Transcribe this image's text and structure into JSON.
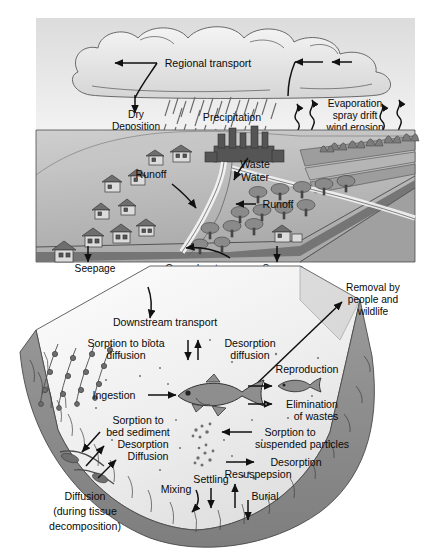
{
  "figure": {
    "background": "#ffffff",
    "sky_color": "#e6e6e6",
    "land_color": "#b8b8b8",
    "water_color": "#ececec",
    "sediment_color": "#8f8f8f",
    "ink_color": "#111111"
  },
  "atmosphere": {
    "regional_transport": "Regional transport",
    "dry_deposition": "Dry\nDeposition",
    "dry_deposition_line1": "Dry",
    "dry_deposition_line2": "Deposition",
    "precipitation": "Precipitation",
    "evaporation_line1": "Evaporation",
    "evaporation_line2": "spray drift",
    "evaporation_line3": "wind erosion"
  },
  "land": {
    "runoff_upper": "Runoff",
    "runoff_lower": "Runoff",
    "waste_water_line1": "Waste",
    "waste_water_line2": "Water",
    "seepage_left": "Seepage",
    "seepage_right": "Seepage",
    "ground_water_line1": "Ground water",
    "ground_water_line2": "discharge",
    "ground_water_line3": "to streams",
    "removal_line1": "Removal by",
    "removal_line2": "people and",
    "removal_line3": "wildlife"
  },
  "water": {
    "downstream_transport": "Downstream transport",
    "sorption_biota_line1": "Sorption to biota",
    "sorption_biota_line2": "diffusion",
    "desorption_line1": "Desorption",
    "desorption_line2": "diffusion",
    "ingestion": "Ingestion",
    "reproduction": "Reproduction",
    "elimination_line1": "Elimination",
    "elimination_line2": "of wastes",
    "sorption_suspended_line1": "Sorption to",
    "sorption_suspended_line2": "suspended particles",
    "desorption_suspended": "Desorption",
    "sorption_bed_line1": "Sorption to",
    "sorption_bed_line2": "bed sediment",
    "desorption_bed": "Desorption",
    "diffusion_bed": "Diffusion",
    "settling": "Settling",
    "mixing": "Mixing",
    "resuspension": "Resuspepsion",
    "burial": "Burial",
    "diffusion_tissue_line1": "Diffusion",
    "diffusion_tissue_line2": "(during tissue",
    "diffusion_tissue_line3": "decomposition)"
  }
}
